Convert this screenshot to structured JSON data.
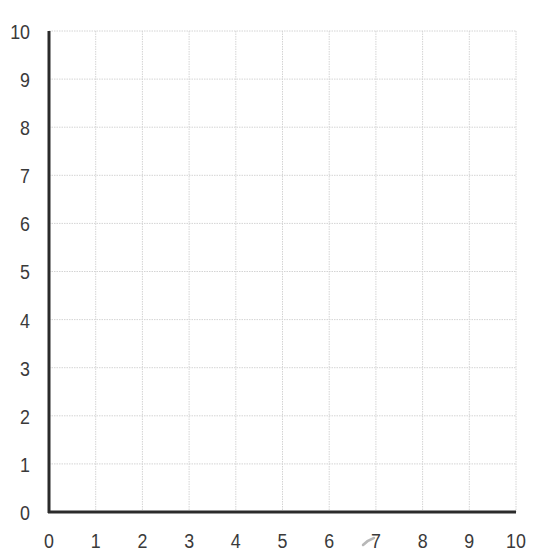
{
  "chart_data": {
    "type": "scatter",
    "title": "",
    "xlabel": "",
    "ylabel": "",
    "x": [],
    "y": [],
    "series": [],
    "xlim": [
      0,
      10
    ],
    "ylim": [
      0,
      10
    ],
    "x_ticks": [
      "0",
      "1",
      "2",
      "3",
      "4",
      "5",
      "6",
      "7",
      "8",
      "9",
      "10"
    ],
    "y_ticks": [
      "0",
      "1",
      "2",
      "3",
      "4",
      "5",
      "6",
      "7",
      "8",
      "9",
      "10"
    ],
    "grid": true,
    "grid_style": "dotted light gray",
    "legend": null,
    "note": "Empty coordinate grid (first quadrant) with no plotted data"
  },
  "colors": {
    "axis": "#2b2b2b",
    "grid": "#d4d4d4",
    "tick_text": "#3a3a3a",
    "stray_mark": "#b0b0b0"
  }
}
